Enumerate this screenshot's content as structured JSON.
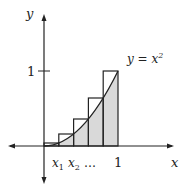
{
  "figure": {
    "axis_x_label": "x",
    "axis_y_label": "y",
    "curve_label_lhs": "y = x",
    "curve_label_exp": "2",
    "y_tick_label": "1",
    "x_tick_label": "1",
    "x1_label": "x",
    "x1_sub": "1",
    "x2_label": "x",
    "x2_sub": "2",
    "ellipsis": "…",
    "colors": {
      "line": "#222222",
      "shade": "#d9d9d9",
      "background": "#ffffff"
    }
  },
  "diagram": {
    "type": "upper Riemann sum of y = x^2 on [0,1]",
    "function": "x^2",
    "interval": [
      0,
      1
    ],
    "n_rectangles": 5,
    "partition": [
      0,
      0.2,
      0.4,
      0.6,
      0.8,
      1.0
    ],
    "rect_heights": [
      0.04,
      0.16,
      0.36,
      0.64,
      1.0
    ],
    "area_under_curve_shaded": true
  }
}
